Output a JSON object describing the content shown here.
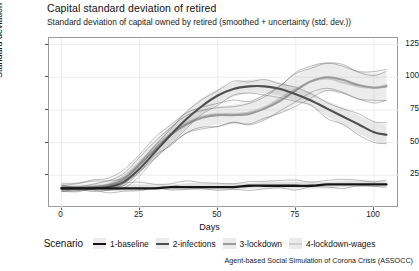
{
  "header": {
    "title": "Capital standard deviation of retired",
    "subtitle": "Standard deviation of capital owned by  retired (smoothed + uncertainty (std. dev.))"
  },
  "caption": "Agent-based Social Simulation of Corona Crisis (ASSOCC)",
  "legend": {
    "title": "Scenario",
    "items": [
      {
        "label": "1-baseline",
        "color": "#141414"
      },
      {
        "label": "2-infections",
        "color": "#4f4f4f"
      },
      {
        "label": "3-lockdown",
        "color": "#9a9a9a"
      },
      {
        "label": "4-lockdown-wages",
        "color": "#cfcfcf"
      }
    ]
  },
  "axes": {
    "x": {
      "label": "Days",
      "ticks": [
        0,
        25,
        50,
        75,
        100
      ],
      "min": -4,
      "max": 108
    },
    "y": {
      "label": "Standard deviation",
      "ticks": [
        25,
        50,
        75,
        100,
        125
      ],
      "min": 0,
      "max": 130
    }
  },
  "chart_data": {
    "type": "line",
    "title": "Capital standard deviation of retired",
    "subtitle": "Standard deviation of capital owned by  retired (smoothed + uncertainty (std. dev.))",
    "xlabel": "Days",
    "ylabel": "Standard deviation",
    "xlim": [
      -4,
      108
    ],
    "ylim": [
      0,
      130
    ],
    "xticks": [
      0,
      25,
      50,
      75,
      100
    ],
    "yticks": [
      25,
      50,
      75,
      100,
      125
    ],
    "grid": true,
    "legend_position": "bottom",
    "legend_title": "Scenario",
    "x": [
      0,
      5,
      10,
      15,
      20,
      25,
      30,
      35,
      40,
      45,
      50,
      55,
      60,
      65,
      70,
      75,
      80,
      85,
      90,
      95,
      100,
      104
    ],
    "series": [
      {
        "name": "1-baseline",
        "color": "#141414",
        "values": [
          15,
          15,
          15,
          15,
          15,
          15,
          15,
          16,
          16,
          16,
          16,
          16,
          17,
          17,
          17,
          17,
          17,
          18,
          18,
          18,
          18,
          18
        ],
        "upper": [
          17,
          17,
          17,
          17,
          18,
          18,
          18,
          18,
          19,
          19,
          19,
          19,
          19,
          20,
          20,
          20,
          20,
          20,
          21,
          21,
          21,
          21
        ],
        "lower": [
          13,
          13,
          13,
          13,
          13,
          13,
          14,
          14,
          14,
          14,
          14,
          14,
          15,
          15,
          15,
          15,
          15,
          15,
          16,
          16,
          16,
          16
        ]
      },
      {
        "name": "2-infections",
        "color": "#4f4f4f",
        "values": [
          15,
          15,
          15,
          16,
          20,
          30,
          43,
          56,
          68,
          78,
          86,
          91,
          93,
          93,
          91,
          87,
          82,
          76,
          70,
          64,
          58,
          56
        ],
        "upper": [
          17,
          17,
          18,
          19,
          24,
          35,
          49,
          62,
          74,
          84,
          91,
          96,
          98,
          98,
          96,
          92,
          88,
          82,
          77,
          71,
          66,
          64
        ],
        "lower": [
          13,
          13,
          13,
          14,
          17,
          26,
          38,
          50,
          62,
          72,
          80,
          85,
          88,
          88,
          86,
          82,
          77,
          70,
          63,
          57,
          51,
          49
        ]
      },
      {
        "name": "3-lockdown",
        "color": "#9a9a9a",
        "values": [
          15,
          15,
          16,
          17,
          22,
          33,
          45,
          56,
          64,
          69,
          71,
          71,
          72,
          76,
          82,
          90,
          97,
          100,
          98,
          94,
          92,
          93
        ],
        "upper": [
          18,
          18,
          19,
          21,
          27,
          39,
          52,
          63,
          71,
          76,
          78,
          79,
          81,
          86,
          93,
          101,
          108,
          111,
          109,
          105,
          103,
          104
        ],
        "lower": [
          13,
          13,
          14,
          15,
          18,
          28,
          39,
          49,
          57,
          62,
          64,
          64,
          64,
          67,
          72,
          79,
          86,
          89,
          87,
          83,
          81,
          82
        ]
      },
      {
        "name": "4-lockdown-wages",
        "color": "#cfcfcf",
        "values": [
          16,
          16,
          16,
          18,
          24,
          35,
          47,
          57,
          65,
          70,
          72,
          72,
          73,
          77,
          84,
          91,
          97,
          99,
          96,
          93,
          92,
          94
        ],
        "upper": [
          19,
          19,
          20,
          22,
          29,
          41,
          54,
          65,
          73,
          78,
          80,
          81,
          83,
          88,
          95,
          103,
          109,
          112,
          109,
          106,
          104,
          106
        ],
        "lower": [
          13,
          13,
          14,
          15,
          19,
          29,
          40,
          50,
          58,
          62,
          64,
          64,
          65,
          68,
          73,
          80,
          87,
          90,
          88,
          84,
          82,
          83
        ]
      }
    ]
  }
}
